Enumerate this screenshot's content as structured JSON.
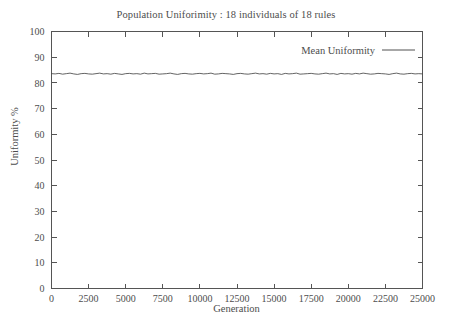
{
  "chart_data": {
    "type": "line",
    "title": "Population Uniforimity : 18 individuals of 18 rules",
    "xlabel": "Generation",
    "ylabel": "Uniformity %",
    "xlim": [
      0,
      25000
    ],
    "ylim": [
      0,
      100
    ],
    "grid": false,
    "legend_position": "top-right",
    "xticks": [
      0,
      2500,
      5000,
      7500,
      10000,
      12500,
      15000,
      17500,
      20000,
      22500,
      25000
    ],
    "xtick_labels": [
      "0",
      "2500",
      "5000",
      "7500",
      "10000",
      "12500",
      "15000",
      "17500",
      "20000",
      "22500",
      "25000"
    ],
    "yticks": [
      0,
      10,
      20,
      30,
      40,
      50,
      60,
      70,
      80,
      90,
      100
    ],
    "ytick_labels": [
      "0",
      "10",
      "20",
      "30",
      "40",
      "50",
      "60",
      "70",
      "80",
      "90",
      "100"
    ],
    "series": [
      {
        "name": "Mean Uniformity",
        "color": "#3c3c3c",
        "x": [
          0,
          250,
          500,
          750,
          1000,
          1250,
          1500,
          1750,
          2000,
          2250,
          2500,
          2750,
          3000,
          3250,
          3500,
          3750,
          4000,
          4250,
          4500,
          4750,
          5000,
          5250,
          5500,
          5750,
          6000,
          6250,
          6500,
          6750,
          7000,
          7250,
          7500,
          7750,
          8000,
          8250,
          8500,
          8750,
          9000,
          9250,
          9500,
          9750,
          10000,
          10250,
          10500,
          10750,
          11000,
          11250,
          11500,
          11750,
          12000,
          12250,
          12500,
          12750,
          13000,
          13250,
          13500,
          13750,
          14000,
          14250,
          14500,
          14750,
          15000,
          15250,
          15500,
          15750,
          16000,
          16250,
          16500,
          16750,
          17000,
          17250,
          17500,
          17750,
          18000,
          18250,
          18500,
          18750,
          19000,
          19250,
          19500,
          19750,
          20000,
          20250,
          20500,
          20750,
          21000,
          21250,
          21500,
          21750,
          22000,
          22250,
          22500,
          22750,
          23000,
          23250,
          23500,
          23750,
          24000,
          24250,
          24500,
          24750,
          25000
        ],
        "values": [
          83.6,
          83.5,
          83.7,
          83.4,
          83.6,
          83.8,
          83.5,
          83.3,
          83.6,
          83.7,
          83.5,
          83.4,
          83.6,
          83.8,
          83.5,
          83.6,
          83.4,
          83.7,
          83.5,
          83.3,
          83.6,
          83.7,
          83.5,
          83.6,
          83.4,
          83.8,
          83.5,
          83.6,
          83.7,
          83.4,
          83.5,
          83.6,
          83.8,
          83.5,
          83.3,
          83.6,
          83.7,
          83.5,
          83.4,
          83.6,
          83.7,
          83.5,
          83.6,
          83.8,
          83.4,
          83.5,
          83.7,
          83.6,
          83.5,
          83.3,
          83.6,
          83.7,
          83.5,
          83.4,
          83.6,
          83.8,
          83.5,
          83.6,
          83.4,
          83.7,
          83.5,
          83.6,
          83.3,
          83.7,
          83.5,
          83.6,
          83.8,
          83.4,
          83.5,
          83.6,
          83.7,
          83.5,
          83.4,
          83.6,
          83.8,
          83.5,
          83.6,
          83.3,
          83.7,
          83.5,
          83.6,
          83.4,
          83.7,
          83.5,
          83.8,
          83.6,
          83.4,
          83.5,
          83.7,
          83.6,
          83.5,
          83.3,
          83.6,
          83.8,
          83.5,
          83.4,
          83.6,
          83.7,
          83.5,
          83.6,
          83.5
        ]
      }
    ]
  },
  "legend": {
    "entries": [
      {
        "label": "Mean Uniformity"
      }
    ]
  }
}
